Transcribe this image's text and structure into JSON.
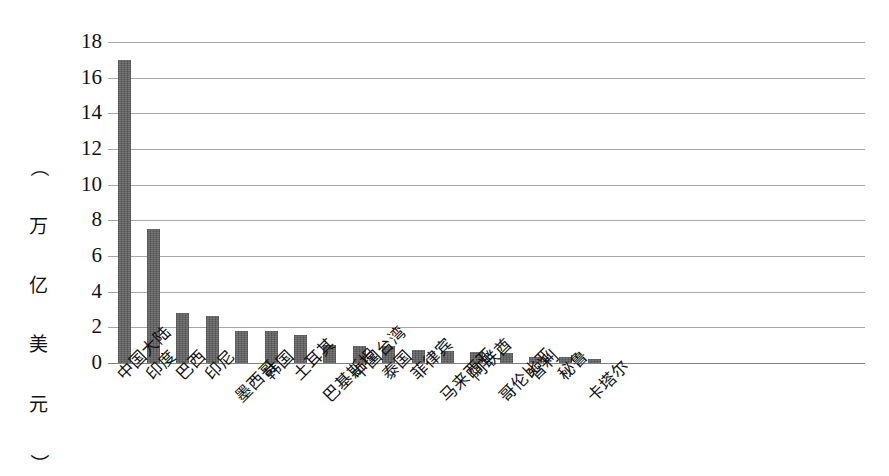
{
  "chart_data": {
    "type": "bar",
    "title": "",
    "subtitle": "",
    "xlabel": "",
    "ylabel": "（万亿美元）",
    "ylabel_chars": [
      "（",
      "万",
      "亿",
      "美",
      "元",
      "）"
    ],
    "ylim": [
      0,
      18
    ],
    "ytick_labels": [
      "18",
      "16",
      "14",
      "12",
      "10",
      "8",
      "6",
      "4",
      "2",
      "0"
    ],
    "ytick_values": [
      18,
      16,
      14,
      12,
      10,
      8,
      6,
      4,
      2,
      0
    ],
    "grid": true,
    "legend": "none",
    "bar_color": "#5b5b5b",
    "gridline_color": "#a6a6a6",
    "categories": [
      "中国大陆",
      "印度",
      "巴西",
      "印尼",
      "墨西哥",
      "韩国",
      "土耳其",
      "巴基斯坦",
      "中国台湾",
      "泰国",
      "菲律宾",
      "马来西亚",
      "阿联酋",
      "哥伦比亚",
      "智利",
      "秘鲁",
      "卡塔尔"
    ],
    "values": [
      17.0,
      7.5,
      2.8,
      2.65,
      1.8,
      1.8,
      1.55,
      1.0,
      0.95,
      0.95,
      0.75,
      0.65,
      0.6,
      0.55,
      0.35,
      0.33,
      0.25
    ],
    "label_offsets": [
      "high",
      "high",
      "high",
      "high",
      "low",
      "high",
      "high",
      "low",
      "high",
      "high",
      "high",
      "low",
      "high",
      "low",
      "high",
      "high",
      "low"
    ]
  }
}
